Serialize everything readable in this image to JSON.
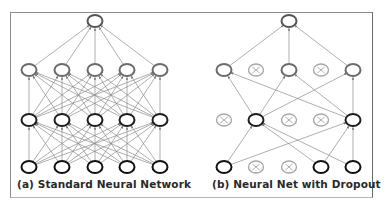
{
  "panels": [
    {
      "id": "a",
      "caption": "(a) Standard Neural Network",
      "layers": [
        {
          "name": "output",
          "y": 21,
          "nodes": [
            {
              "x": 95,
              "dropped": false
            }
          ]
        },
        {
          "name": "hidden2",
          "y": 70,
          "nodes": [
            {
              "x": 29,
              "dropped": false
            },
            {
              "x": 62,
              "dropped": false
            },
            {
              "x": 95,
              "dropped": false
            },
            {
              "x": 127,
              "dropped": false
            },
            {
              "x": 160,
              "dropped": false
            }
          ]
        },
        {
          "name": "hidden1",
          "y": 120,
          "nodes": [
            {
              "x": 29,
              "dropped": false
            },
            {
              "x": 62,
              "dropped": false
            },
            {
              "x": 95,
              "dropped": false
            },
            {
              "x": 127,
              "dropped": false
            },
            {
              "x": 160,
              "dropped": false
            }
          ]
        },
        {
          "name": "input",
          "y": 167,
          "nodes": [
            {
              "x": 29,
              "dropped": false
            },
            {
              "x": 62,
              "dropped": false
            },
            {
              "x": 95,
              "dropped": false
            },
            {
              "x": 127,
              "dropped": false
            },
            {
              "x": 160,
              "dropped": false
            }
          ]
        }
      ],
      "fully_connected": true
    },
    {
      "id": "b",
      "caption": "(b) Neural Net with Dropout",
      "layers": [
        {
          "name": "output",
          "y": 21,
          "nodes": [
            {
              "x": 289,
              "dropped": false
            }
          ]
        },
        {
          "name": "hidden2",
          "y": 70,
          "nodes": [
            {
              "x": 224,
              "dropped": false
            },
            {
              "x": 256,
              "dropped": true
            },
            {
              "x": 289,
              "dropped": false
            },
            {
              "x": 321,
              "dropped": true
            },
            {
              "x": 353,
              "dropped": false
            }
          ]
        },
        {
          "name": "hidden1",
          "y": 120,
          "nodes": [
            {
              "x": 224,
              "dropped": true
            },
            {
              "x": 256,
              "dropped": false
            },
            {
              "x": 289,
              "dropped": true
            },
            {
              "x": 321,
              "dropped": true
            },
            {
              "x": 353,
              "dropped": false
            }
          ]
        },
        {
          "name": "input",
          "y": 167,
          "nodes": [
            {
              "x": 224,
              "dropped": false
            },
            {
              "x": 256,
              "dropped": true
            },
            {
              "x": 289,
              "dropped": true
            },
            {
              "x": 321,
              "dropped": false
            },
            {
              "x": 353,
              "dropped": false
            }
          ]
        }
      ],
      "fully_connected": false,
      "edges": [
        [
          [
            224,
            70
          ],
          [
            289,
            21
          ]
        ],
        [
          [
            289,
            70
          ],
          [
            289,
            21
          ]
        ],
        [
          [
            353,
            70
          ],
          [
            289,
            21
          ]
        ],
        [
          [
            256,
            120
          ],
          [
            224,
            70
          ]
        ],
        [
          [
            256,
            120
          ],
          [
            289,
            70
          ]
        ],
        [
          [
            256,
            120
          ],
          [
            353,
            70
          ]
        ],
        [
          [
            353,
            120
          ],
          [
            224,
            70
          ]
        ],
        [
          [
            353,
            120
          ],
          [
            289,
            70
          ]
        ],
        [
          [
            353,
            120
          ],
          [
            353,
            70
          ]
        ],
        [
          [
            224,
            167
          ],
          [
            256,
            120
          ]
        ],
        [
          [
            224,
            167
          ],
          [
            353,
            120
          ]
        ],
        [
          [
            321,
            167
          ],
          [
            256,
            120
          ]
        ],
        [
          [
            321,
            167
          ],
          [
            353,
            120
          ]
        ],
        [
          [
            353,
            167
          ],
          [
            256,
            120
          ]
        ],
        [
          [
            353,
            167
          ],
          [
            353,
            120
          ]
        ]
      ]
    }
  ],
  "colors": {
    "node_input": "#111111",
    "node_hidden1": "#1e1e1e",
    "node_hidden2": "#6b6b6b",
    "node_output": "#555555",
    "node_dropped": "#a8a8a8",
    "edge": "#8c8c8c",
    "frame": "#8a8a8a"
  },
  "node_radius": {
    "rx": 7.5,
    "ry": 6
  }
}
